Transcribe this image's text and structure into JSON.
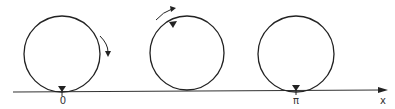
{
  "diagram": {
    "axis": {
      "label": "x",
      "color": "#333333"
    },
    "ticks": [
      {
        "label": "0"
      },
      {
        "label": "π"
      }
    ],
    "circles": [
      {
        "name": "start-position",
        "rotation": "clockwise"
      },
      {
        "name": "mid-position",
        "rotation": "counterclockwise"
      },
      {
        "name": "end-position"
      }
    ]
  }
}
